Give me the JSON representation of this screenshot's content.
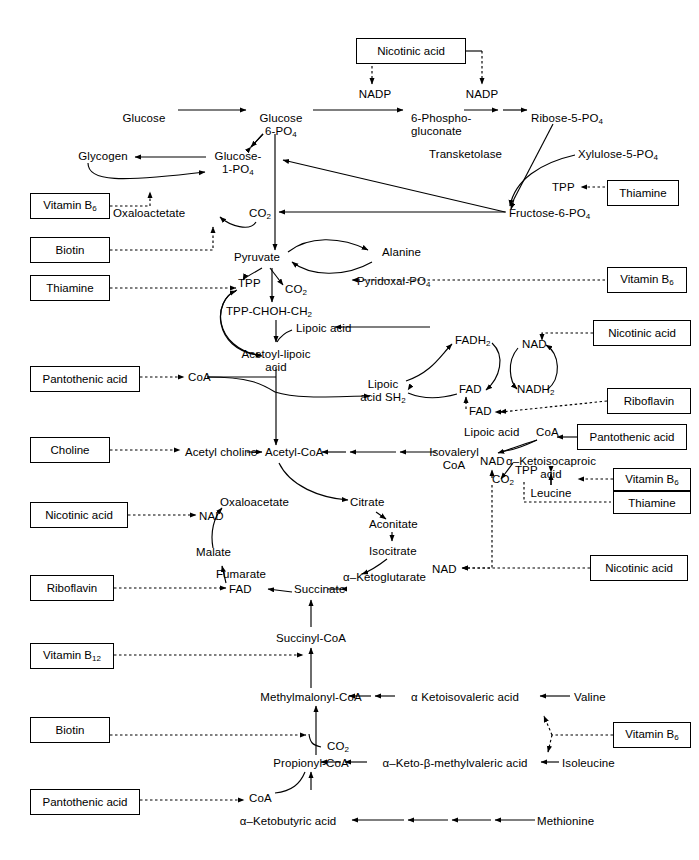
{
  "diagram": {
    "line_color": "#000000",
    "background": "#ffffff"
  },
  "vitamin_boxes": [
    {
      "id": "nicotinic-top",
      "label": "Nicotinic acid",
      "x": 356,
      "y": 38,
      "w": 110
    },
    {
      "id": "thiamine-tpp-right",
      "label": "Thiamine",
      "x": 607,
      "y": 180,
      "w": 72
    },
    {
      "id": "vitamin-b6-oaa",
      "label": "Vitamin B6",
      "x": 30,
      "y": 193,
      "w": 80,
      "sub": "6"
    },
    {
      "id": "biotin-oaa",
      "label": "Biotin",
      "x": 30,
      "y": 237,
      "w": 80
    },
    {
      "id": "thiamine-tpp-left",
      "label": "Thiamine",
      "x": 30,
      "y": 275,
      "w": 80
    },
    {
      "id": "vitamin-b6-pyridoxal",
      "label": "Vitamin B6",
      "x": 607,
      "y": 267,
      "w": 80,
      "sub": "6"
    },
    {
      "id": "nicotinic-nad-lipoic",
      "label": "Nicotinic acid",
      "x": 593,
      "y": 320,
      "w": 98
    },
    {
      "id": "pantothenic-coa-left",
      "label": "Pantothenic acid",
      "x": 30,
      "y": 366,
      "w": 110
    },
    {
      "id": "riboflavin-fad",
      "label": "Riboflavin",
      "x": 607,
      "y": 388,
      "w": 84
    },
    {
      "id": "pantothenic-coa-right",
      "label": "Pantothenic acid",
      "x": 577,
      "y": 424,
      "w": 110
    },
    {
      "id": "choline",
      "label": "Choline",
      "x": 30,
      "y": 437,
      "w": 80
    },
    {
      "id": "vitamin-b6-leucine",
      "label": "Vitamin B6",
      "x": 613,
      "y": 468,
      "w": 78,
      "sub": "6"
    },
    {
      "id": "thiamine-leucine",
      "label": "Thiamine",
      "x": 613,
      "y": 492,
      "w": 78
    },
    {
      "id": "nicotinic-nad-malate",
      "label": "Nicotinic acid",
      "x": 30,
      "y": 502,
      "w": 98
    },
    {
      "id": "riboflavin-fumarate",
      "label": "Riboflavin",
      "x": 30,
      "y": 575,
      "w": 84
    },
    {
      "id": "nicotinic-nad-akg",
      "label": "Nicotinic acid",
      "x": 590,
      "y": 555,
      "w": 98
    },
    {
      "id": "vitamin-b12",
      "label": "Vitamin B12",
      "x": 30,
      "y": 643,
      "w": 84,
      "sub": "12"
    },
    {
      "id": "biotin-propionyl",
      "label": "Biotin",
      "x": 30,
      "y": 717,
      "w": 80
    },
    {
      "id": "vitamin-b6-isoleucine",
      "label": "Vitamin B6",
      "x": 613,
      "y": 722,
      "w": 78,
      "sub": "6"
    },
    {
      "id": "pantothenic-coa-bottom",
      "label": "Pantothenic acid",
      "x": 30,
      "y": 789,
      "w": 110
    }
  ],
  "metabolites": [
    {
      "id": "nadp-left",
      "text": "NADP",
      "x": 375,
      "y": 88,
      "align": "center"
    },
    {
      "id": "nadp-right",
      "text": "NADP",
      "x": 469,
      "y": 88,
      "align": "center"
    },
    {
      "id": "glucose",
      "text": "Glucose",
      "x": 144,
      "y": 112,
      "align": "center"
    },
    {
      "id": "glucose-6-po4",
      "text": "Glucose 6-PO4",
      "x": 281,
      "y": 112,
      "align": "center",
      "lines": [
        "Glucose",
        "6-PO4"
      ],
      "sub": "4"
    },
    {
      "id": "phosphogluconate",
      "text": "6-Phospho-gluconate",
      "x": 414,
      "y": 112,
      "align": "left",
      "lines": [
        "6-Phospho-",
        "gluconate"
      ]
    },
    {
      "id": "ribose-5-po4",
      "text": "Ribose-5-PO4",
      "x": 531,
      "y": 112,
      "align": "left",
      "sub": "4"
    },
    {
      "id": "transketolase",
      "text": "Transketolase",
      "x": 429,
      "y": 148,
      "align": "left"
    },
    {
      "id": "xylulose-5-po4",
      "text": "Xylulose-5-PO4",
      "x": 578,
      "y": 148,
      "align": "left",
      "sub": "4"
    },
    {
      "id": "tpp-transketolase",
      "text": "TPP",
      "x": 555,
      "y": 187,
      "align": "left"
    },
    {
      "id": "fructose-6-po4",
      "text": "Fructose-6-PO4",
      "x": 509,
      "y": 213,
      "align": "left",
      "sub": "4"
    },
    {
      "id": "glycogen",
      "text": "Glycogen",
      "x": 103,
      "y": 155,
      "align": "center"
    },
    {
      "id": "glucose-1-po4",
      "text": "Glucose-1-PO4",
      "x": 238,
      "y": 155,
      "align": "center",
      "lines": [
        "Glucose-",
        "1-PO4"
      ],
      "sub": "4"
    },
    {
      "id": "oxaloactetate",
      "text": "Oxaloactetate",
      "x": 173,
      "y": 213,
      "align": "left"
    },
    {
      "id": "co2-oaa",
      "text": "CO2",
      "x": 249,
      "y": 213,
      "align": "left",
      "sub": "2"
    },
    {
      "id": "pyruvate",
      "text": "Pyruvate",
      "x": 257,
      "y": 257,
      "align": "center"
    },
    {
      "id": "alanine",
      "text": "Alanine",
      "x": 382,
      "y": 252,
      "align": "left"
    },
    {
      "id": "pyridoxal-po4",
      "text": "Pyridoxal-PO4",
      "x": 347,
      "y": 281,
      "align": "left",
      "sub": "4"
    },
    {
      "id": "tpp-pyruvate",
      "text": "TPP",
      "x": 240,
      "y": 283,
      "align": "left"
    },
    {
      "id": "co2-pyruvate",
      "text": "CO2",
      "x": 286,
      "y": 289,
      "align": "left",
      "sub": "2"
    },
    {
      "id": "tpp-chohch2",
      "text": "TPP-CHOH-CH2",
      "x": 228,
      "y": 311,
      "align": "left",
      "sub": "2"
    },
    {
      "id": "lipoic-acid-top",
      "text": "Lipoic acid",
      "x": 296,
      "y": 327,
      "align": "left"
    },
    {
      "id": "acetoyl-lipoic",
      "text": "Acetoyl-lipoic acid",
      "x": 276,
      "y": 353,
      "align": "center",
      "lines": [
        "Acetoyl-lipoic",
        "acid"
      ]
    },
    {
      "id": "coa-pantothenic",
      "text": "CoA",
      "x": 190,
      "y": 375,
      "align": "left"
    },
    {
      "id": "lipoic-acid-sh2",
      "text": "Lipoic acid SH2",
      "x": 383,
      "y": 383,
      "align": "center",
      "lines": [
        "Lipoic",
        "acid SH2"
      ],
      "sub": "2"
    },
    {
      "id": "fadh2",
      "text": "FADH2",
      "x": 456,
      "y": 340,
      "align": "left",
      "sub": "2"
    },
    {
      "id": "fad-cycle",
      "text": "FAD",
      "x": 459,
      "y": 389,
      "align": "left"
    },
    {
      "id": "nad-lipoic",
      "text": "NAD",
      "x": 524,
      "y": 344,
      "align": "left"
    },
    {
      "id": "nadh2",
      "text": "NADH2",
      "x": 519,
      "y": 389,
      "align": "left",
      "sub": "2"
    },
    {
      "id": "fad-riboflavin",
      "text": "FAD",
      "x": 471,
      "y": 410,
      "align": "left"
    },
    {
      "id": "lipoic-acid-iso",
      "text": "Lipoic acid",
      "x": 464,
      "y": 431,
      "align": "left"
    },
    {
      "id": "coa-isovaleryl",
      "text": "CoA",
      "x": 538,
      "y": 431,
      "align": "left"
    },
    {
      "id": "acetyl-choline",
      "text": "Acetyl choline",
      "x": 185,
      "y": 452,
      "align": "left"
    },
    {
      "id": "acetyl-coa",
      "text": "Acetyl-CoA",
      "x": 266,
      "y": 452,
      "align": "left"
    },
    {
      "id": "isovaleryl-coa",
      "text": "Isovaleryl CoA",
      "x": 450,
      "y": 452,
      "align": "center",
      "lines": [
        "Isovaleryl",
        "CoA"
      ]
    },
    {
      "id": "nad-isovaleryl",
      "text": "NAD",
      "x": 484,
      "y": 460,
      "align": "left"
    },
    {
      "id": "tpp-isovaleryl",
      "text": "TPP",
      "x": 519,
      "y": 470,
      "align": "left"
    },
    {
      "id": "co2-isovaleryl",
      "text": "CO2",
      "x": 494,
      "y": 478,
      "align": "left",
      "sub": "2"
    },
    {
      "id": "ketoisocaproic",
      "text": "a-Ketoisocaproic acid",
      "x": 551,
      "y": 460,
      "align": "center",
      "lines": [
        "α–Ketoisocaproic",
        "acid"
      ]
    },
    {
      "id": "leucine",
      "text": "Leucine",
      "x": 551,
      "y": 492,
      "align": "center"
    },
    {
      "id": "citrate",
      "text": "Citrate",
      "x": 353,
      "y": 502,
      "align": "left"
    },
    {
      "id": "aconitate",
      "text": "Aconitate",
      "x": 371,
      "y": 522,
      "align": "left"
    },
    {
      "id": "isocitrate",
      "text": "Isocitrate",
      "x": 371,
      "y": 549,
      "align": "left"
    },
    {
      "id": "oxaloacetate-tca",
      "text": "Oxaloacetate",
      "x": 222,
      "y": 502,
      "align": "left"
    },
    {
      "id": "nad-malate",
      "text": "NAD",
      "x": 201,
      "y": 516,
      "align": "left"
    },
    {
      "id": "malate",
      "text": "Malate",
      "x": 198,
      "y": 551,
      "align": "left"
    },
    {
      "id": "fumarate",
      "text": "Fumarate",
      "x": 218,
      "y": 573,
      "align": "left"
    },
    {
      "id": "fad-fumarate",
      "text": "FAD",
      "x": 231,
      "y": 589,
      "align": "left"
    },
    {
      "id": "succinate",
      "text": "Succinate",
      "x": 296,
      "y": 589,
      "align": "left"
    },
    {
      "id": "ketoglutarate",
      "text": "a-Ketoglutarate",
      "x": 345,
      "y": 577,
      "align": "left"
    },
    {
      "id": "nad-akg",
      "text": "NAD",
      "x": 434,
      "y": 570,
      "align": "left"
    },
    {
      "id": "succinyl-coa",
      "text": "Succinyl-CoA",
      "x": 288,
      "y": 637,
      "align": "center"
    },
    {
      "id": "methylmalonyl-coa",
      "text": "Methylmalonyl-CoA",
      "x": 288,
      "y": 696,
      "align": "center"
    },
    {
      "id": "ketoisovaleric",
      "text": "a Ketoisovaleric acid",
      "x": 455,
      "y": 696,
      "align": "center"
    },
    {
      "id": "valine",
      "text": "Valine",
      "x": 576,
      "y": 696,
      "align": "left"
    },
    {
      "id": "co2-propionyl",
      "text": "CO2",
      "x": 309,
      "y": 745,
      "align": "left",
      "sub": "2"
    },
    {
      "id": "propionyl-coa",
      "text": "Propionyl-CoA",
      "x": 288,
      "y": 762,
      "align": "center"
    },
    {
      "id": "keto-methylvaleric",
      "text": "a-Keto-b-methylvaleric acid",
      "x": 455,
      "y": 762,
      "align": "center"
    },
    {
      "id": "isoleucine",
      "text": "Isoleucine",
      "x": 564,
      "y": 762,
      "align": "left"
    },
    {
      "id": "coa-bottom",
      "text": "CoA",
      "x": 250,
      "y": 797,
      "align": "left"
    },
    {
      "id": "ketobutyric",
      "text": "a-Ketobutyric acid",
      "x": 288,
      "y": 820,
      "align": "center"
    },
    {
      "id": "methionine",
      "text": "Methionine",
      "x": 539,
      "y": 820,
      "align": "left"
    }
  ]
}
